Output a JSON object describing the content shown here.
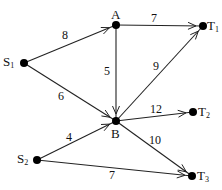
{
  "diagram": {
    "type": "directed-weighted-graph",
    "nodes": [
      {
        "id": "S1",
        "label": "S",
        "sub": "1",
        "x": 24,
        "y": 63,
        "lx": 3,
        "ly": 55
      },
      {
        "id": "S2",
        "label": "S",
        "sub": "2",
        "x": 37,
        "y": 160,
        "lx": 17,
        "ly": 152
      },
      {
        "id": "A",
        "label": "A",
        "sub": "",
        "x": 116,
        "y": 25,
        "lx": 111,
        "ly": 8
      },
      {
        "id": "B",
        "label": "B",
        "sub": "",
        "x": 116,
        "y": 121,
        "lx": 111,
        "ly": 127
      },
      {
        "id": "T1",
        "label": "T",
        "sub": "1",
        "x": 203,
        "y": 26,
        "lx": 207,
        "ly": 19
      },
      {
        "id": "T2",
        "label": "T",
        "sub": "2",
        "x": 193,
        "y": 112,
        "lx": 198,
        "ly": 105
      },
      {
        "id": "T3",
        "label": "T",
        "sub": "3",
        "x": 192,
        "y": 176,
        "lx": 197,
        "ly": 169
      }
    ],
    "edges": [
      {
        "from": "S1",
        "to": "A",
        "weight": "8",
        "lx": 62,
        "ly": 29
      },
      {
        "from": "S1",
        "to": "B",
        "weight": "6",
        "lx": 58,
        "ly": 90
      },
      {
        "from": "A",
        "to": "T1",
        "weight": "7",
        "lx": 151,
        "ly": 12
      },
      {
        "from": "A",
        "to": "B",
        "weight": "5",
        "lx": 104,
        "ly": 65
      },
      {
        "from": "B",
        "to": "T1",
        "weight": "9",
        "lx": 153,
        "ly": 60
      },
      {
        "from": "B",
        "to": "T2",
        "weight": "12",
        "lx": 150,
        "ly": 103
      },
      {
        "from": "B",
        "to": "T3",
        "weight": "10",
        "lx": 149,
        "ly": 134
      },
      {
        "from": "S2",
        "to": "B",
        "weight": "4",
        "lx": 66,
        "ly": 131
      },
      {
        "from": "S2",
        "to": "T3",
        "weight": "7",
        "lx": 109,
        "ly": 169
      }
    ]
  }
}
